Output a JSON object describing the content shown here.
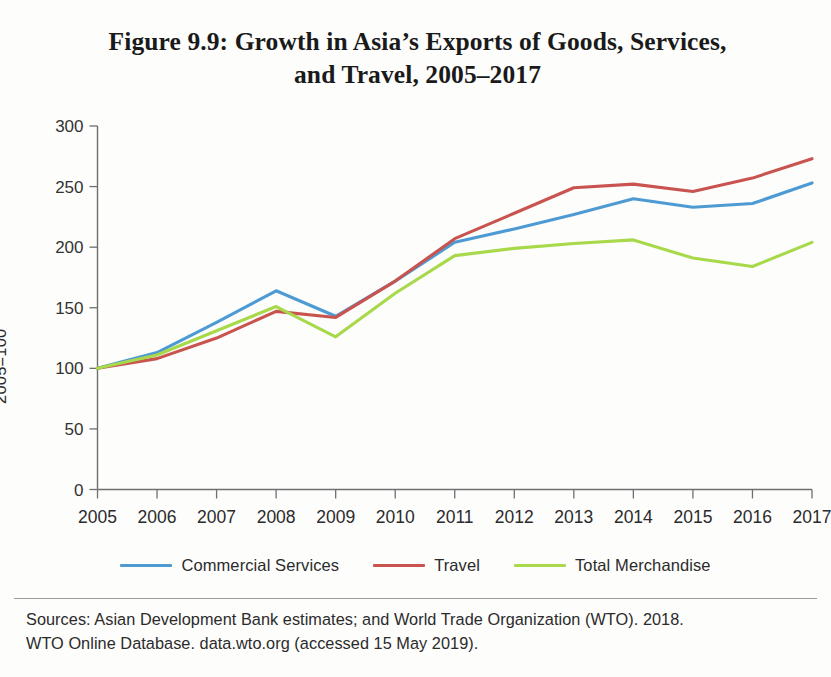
{
  "title": {
    "line1": "Figure 9.9: Growth in Asia’s Exports of Goods, Services,",
    "line2": "and Travel, 2005–2017"
  },
  "y_axis_title": "2005=100",
  "legend": [
    {
      "label": "Commercial Services",
      "color": "#4E9BD4"
    },
    {
      "label": "Travel",
      "color": "#C9544F"
    },
    {
      "label": "Total Merchandise",
      "color": "#A8D94B"
    }
  ],
  "source": {
    "line1": "Sources: Asian Development Bank estimates; and World Trade Organization (WTO). 2018.",
    "line2": "WTO Online Database. data.wto.org (accessed 15 May 2019)."
  },
  "chart_data": {
    "type": "line",
    "title": "Figure 9.9: Growth in Asia’s Exports of Goods, Services, and Travel, 2005–2017",
    "xlabel": "",
    "ylabel": "2005=100",
    "x": [
      2005,
      2006,
      2007,
      2008,
      2009,
      2010,
      2011,
      2012,
      2013,
      2014,
      2015,
      2016,
      2017
    ],
    "xtick_labels": [
      "2005",
      "2006",
      "2007",
      "2008",
      "2009",
      "2010",
      "2011",
      "2012",
      "2013",
      "2014",
      "2015",
      "2016",
      "2017"
    ],
    "ytick_labels": [
      "0",
      "50",
      "100",
      "150",
      "200",
      "250",
      "300"
    ],
    "yticks": [
      0,
      50,
      100,
      150,
      200,
      250,
      300
    ],
    "ylim": [
      0,
      300
    ],
    "xlim": [
      2005,
      2017
    ],
    "grid": false,
    "legend_position": "bottom",
    "series": [
      {
        "name": "Commercial Services",
        "color": "#4E9BD4",
        "values": [
          100,
          113,
          138,
          164,
          143,
          172,
          204,
          215,
          227,
          240,
          233,
          236,
          253
        ]
      },
      {
        "name": "Travel",
        "color": "#C9544F",
        "values": [
          100,
          108,
          125,
          147,
          142,
          172,
          207,
          228,
          249,
          252,
          246,
          257,
          273
        ]
      },
      {
        "name": "Total Merchandise",
        "color": "#A8D94B",
        "values": [
          100,
          111,
          131,
          151,
          126,
          162,
          193,
          199,
          203,
          206,
          191,
          184,
          204
        ]
      }
    ]
  }
}
